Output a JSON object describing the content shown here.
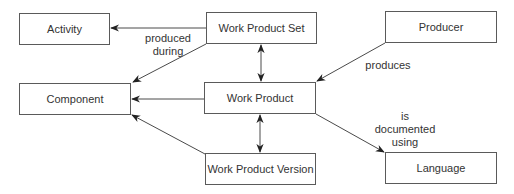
{
  "diagram": {
    "nodes": [
      {
        "id": "activity",
        "label": "Activity",
        "x": 19,
        "y": 13,
        "w": 91,
        "h": 32
      },
      {
        "id": "work-product-set",
        "label": "Work Product Set",
        "x": 206,
        "y": 12,
        "w": 111,
        "h": 32
      },
      {
        "id": "producer",
        "label": "Producer",
        "x": 385,
        "y": 11,
        "w": 112,
        "h": 32
      },
      {
        "id": "component",
        "label": "Component",
        "x": 19,
        "y": 83,
        "w": 112,
        "h": 32
      },
      {
        "id": "work-product",
        "label": "Work Product",
        "x": 204,
        "y": 82,
        "w": 112,
        "h": 32
      },
      {
        "id": "work-product-version",
        "label": "Work Product Version",
        "x": 205,
        "y": 153,
        "w": 111,
        "h": 32
      },
      {
        "id": "language",
        "label": "Language",
        "x": 385,
        "y": 152,
        "w": 112,
        "h": 32
      }
    ],
    "edges": [
      {
        "from": "work-product-set",
        "to": "activity",
        "label": "produced during"
      },
      {
        "from": "work-product-set",
        "to": "component",
        "label": ""
      },
      {
        "from": "work-product-set",
        "to": "work-product",
        "label": "",
        "bidirectional": true
      },
      {
        "from": "producer",
        "to": "work-product",
        "label": "produces"
      },
      {
        "from": "work-product",
        "to": "component",
        "label": ""
      },
      {
        "from": "work-product",
        "to": "work-product-version",
        "label": "",
        "bidirectional": true
      },
      {
        "from": "work-product-version",
        "to": "component",
        "label": ""
      },
      {
        "from": "work-product",
        "to": "language",
        "label": "is documented using"
      }
    ],
    "edge_labels": {
      "produced_during_line1": "produced",
      "produced_during_line2": "during",
      "produces": "produces",
      "documented_line1": "is",
      "documented_line2": "documented",
      "documented_line3": "using"
    },
    "colors": {
      "line": "#4a4a4a",
      "box_border": "#5a5a5a",
      "text": "#333333"
    }
  }
}
